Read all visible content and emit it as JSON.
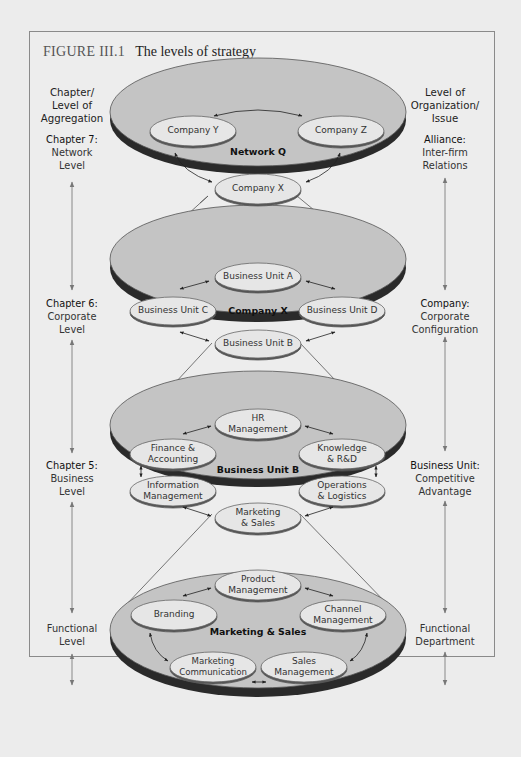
{
  "figure": {
    "number": "FIGURE III.1",
    "caption": "The levels of strategy"
  },
  "left_column": {
    "header": [
      "Chapter/",
      "Level of",
      "Aggregation"
    ],
    "levels": [
      {
        "heading": "Chapter 7:",
        "lines": [
          "Network",
          "Level"
        ]
      },
      {
        "heading": "Chapter 6:",
        "lines": [
          "Corporate",
          "Level"
        ]
      },
      {
        "heading": "Chapter 5:",
        "lines": [
          "Business",
          "Level"
        ]
      },
      {
        "heading": "",
        "lines": [
          "Functional",
          "Level"
        ]
      }
    ]
  },
  "right_column": {
    "header": [
      "Level of",
      "Organization/",
      "Issue"
    ],
    "levels": [
      {
        "heading": "Alliance:",
        "lines": [
          "Inter-firm",
          "Relations"
        ]
      },
      {
        "heading": "Company:",
        "lines": [
          "Corporate",
          "Configuration"
        ]
      },
      {
        "heading": "Business Unit:",
        "lines": [
          "Competitive",
          "Advantage"
        ]
      },
      {
        "heading": "",
        "lines": [
          "Functional",
          "Department"
        ]
      }
    ]
  },
  "disks": [
    {
      "center_label": "Network Q",
      "nodes": [
        "Company Y",
        "Company Z",
        "Company X"
      ]
    },
    {
      "center_label": "Company X",
      "nodes": [
        "Business Unit A",
        "Business Unit C",
        "Business Unit D",
        "Business Unit B"
      ]
    },
    {
      "center_label": "Business Unit B",
      "nodes": [
        "HR\nManagement",
        "Finance &\nAccounting",
        "Knowledge\n& R&D",
        "Information\nManagement",
        "Operations\n& Logistics",
        "Marketing\n& Sales"
      ]
    },
    {
      "center_label": "Marketing & Sales",
      "nodes": [
        "Product\nManagement",
        "Branding",
        "Channel\nManagement",
        "Marketing\nCommunication",
        "Sales\nManagement"
      ]
    }
  ],
  "colors": {
    "disk_top": "#c4c4c4",
    "disk_side": "#2a2a2a",
    "node_fill": "#e6e6e6",
    "node_shadow": "#555555",
    "frame_border": "#8a8a8a",
    "background": "#ededed"
  }
}
